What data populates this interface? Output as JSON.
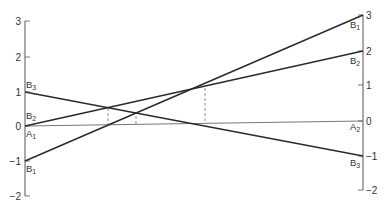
{
  "diagram": {
    "type": "two-axis line diagram",
    "colors": {
      "line": "#2a2a2a",
      "axis": "#555555",
      "baseline": "#666666",
      "dashed": "#777777",
      "text": "#333333"
    },
    "left_axis": {
      "ticks": [
        {
          "value": "3",
          "label": "3"
        },
        {
          "value": "2",
          "label": "2"
        },
        {
          "value": "1",
          "label": "1"
        },
        {
          "value": "0",
          "label": "0"
        },
        {
          "value": "-1",
          "label": "−1"
        },
        {
          "value": "-2",
          "label": "−2"
        }
      ]
    },
    "right_axis": {
      "ticks": [
        {
          "value": "3",
          "label": "3"
        },
        {
          "value": "2",
          "label": "2"
        },
        {
          "value": "1",
          "label": "1"
        },
        {
          "value": "0",
          "label": "0"
        },
        {
          "value": "-1",
          "label": "−1"
        },
        {
          "value": "-2",
          "label": "−2"
        }
      ]
    },
    "lines": [
      {
        "name": "A",
        "left_label": "A",
        "left_sub": "1",
        "right_label": "A",
        "right_sub": "2",
        "left_value": 0,
        "right_value": 0
      },
      {
        "name": "B1",
        "left_label": "B",
        "left_sub": "1",
        "right_label": "B",
        "right_sub": "1",
        "left_value": -1,
        "right_value": 3
      },
      {
        "name": "B2",
        "left_label": "B",
        "left_sub": "2",
        "right_label": "B",
        "right_sub": "2",
        "left_value": 0,
        "right_value": 2
      },
      {
        "name": "B3",
        "left_label": "B",
        "left_sub": "3",
        "right_label": "B",
        "right_sub": "3",
        "left_value": 1,
        "right_value": -1
      }
    ],
    "intersections": [
      {
        "lines": "B2-B3",
        "dashed_drop": true
      },
      {
        "lines": "B1-B3",
        "dashed_drop": true
      },
      {
        "lines": "B1-B2",
        "dashed_drop": true
      }
    ]
  }
}
